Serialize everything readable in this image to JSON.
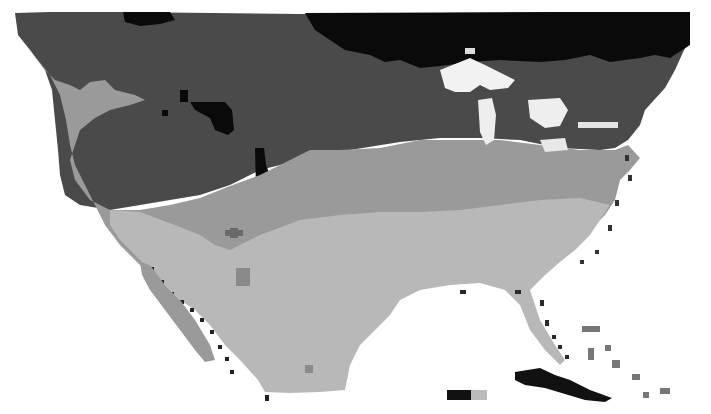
{
  "map": {
    "kind": "grayscale zone map of North America (pixelated raster)",
    "legend": null,
    "colors": {
      "background": "#ffffff",
      "zone_darkest": "#0a0a0a",
      "zone_dark": "#4a4a4a",
      "zone_mid": "#9a9a9a",
      "zone_light": "#b8b8b8",
      "water_lakes": "#f2f2f2",
      "coast_edge": "#222222"
    },
    "regions": [
      {
        "name": "northern-band",
        "shade": "zone_darkest"
      },
      {
        "name": "northern-interior",
        "shade": "zone_dark"
      },
      {
        "name": "central-band",
        "shade": "zone_mid"
      },
      {
        "name": "southern-band",
        "shade": "zone_light"
      },
      {
        "name": "great-lakes",
        "shade": "water_lakes"
      },
      {
        "name": "caribbean-islands",
        "shade": "coast_edge"
      }
    ]
  }
}
